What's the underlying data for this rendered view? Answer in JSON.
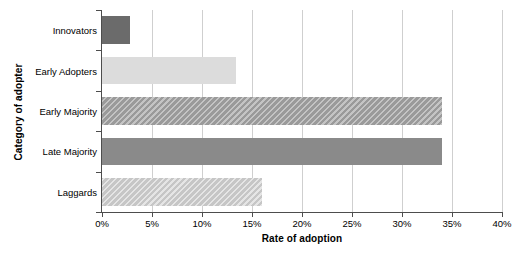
{
  "chart_data": {
    "type": "bar",
    "orientation": "horizontal",
    "title": "",
    "xlabel": "Rate of adoption",
    "ylabel": "Category of adopter",
    "categories": [
      "Innovators",
      "Early Adopters",
      "Early Majority",
      "Late Majority",
      "Laggards"
    ],
    "values": [
      2.8,
      13.4,
      34.0,
      34.0,
      16.0
    ],
    "value_unit": "%",
    "xlim": [
      0,
      40
    ],
    "ylim": null,
    "xticks": [
      0,
      5,
      10,
      15,
      20,
      25,
      30,
      35,
      40
    ],
    "xtick_labels": [
      "0%",
      "5%",
      "10%",
      "15%",
      "20%",
      "25%",
      "30%",
      "35%",
      "40%"
    ],
    "grid": "vertical",
    "legend": null,
    "series": [
      {
        "name": "Rate of adoption",
        "values": [
          2.8,
          13.4,
          34.0,
          34.0,
          16.0
        ],
        "bar_styles": [
          "solid-dark",
          "solid-light",
          "hatch-mid",
          "solid-mid",
          "hatch-light"
        ],
        "colors": [
          "#6b6b6b",
          "#dcdcdc",
          "#9a9a9a",
          "#8a8a8a",
          "#c6c6c6"
        ]
      }
    ]
  },
  "axes": {
    "x_title": "Rate of adoption",
    "y_title": "Category of adopter"
  },
  "colors": {
    "background": "#ffffff",
    "gridline": "#cfcfcf",
    "axis": "#4d4d4d",
    "text": "#000000"
  }
}
